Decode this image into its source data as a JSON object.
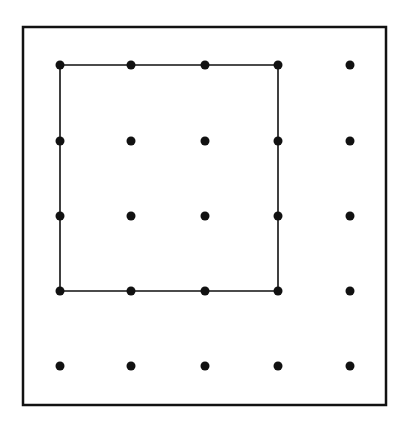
{
  "diagram": {
    "colors": {
      "background": "#ffffff",
      "ink": "#111111"
    },
    "frame": {
      "x": 23,
      "y": 27,
      "width": 363,
      "height": 378
    },
    "grid": {
      "columns_x": [
        60,
        131,
        205,
        278,
        350
      ],
      "rows_y": [
        65,
        141,
        216,
        291,
        366
      ],
      "dot_radius": 4.5
    },
    "drawn_square": {
      "corners": [
        [
          60,
          65
        ],
        [
          278,
          65
        ],
        [
          278,
          291
        ],
        [
          60,
          291
        ]
      ],
      "spans_dots": "4x4 (columns 1-4, rows 1-4)"
    }
  }
}
